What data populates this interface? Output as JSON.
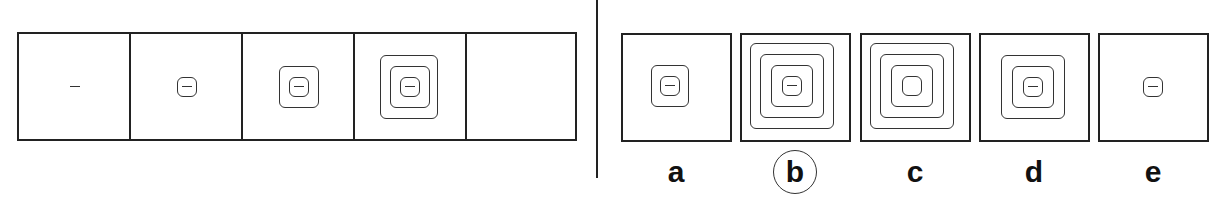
{
  "puzzle": {
    "sequence": {
      "cells": [
        {
          "index": 1,
          "squares": 0,
          "has_dash": true
        },
        {
          "index": 2,
          "squares": 1,
          "has_dash": true
        },
        {
          "index": 3,
          "squares": 2,
          "has_dash": true
        },
        {
          "index": 4,
          "squares": 3,
          "has_dash": true
        },
        {
          "index": 5,
          "squares": null,
          "has_dash": false,
          "empty": true
        }
      ]
    },
    "options": [
      {
        "label": "a",
        "squares": 2,
        "has_dash": true,
        "selected": false
      },
      {
        "label": "b",
        "squares": 4,
        "has_dash": true,
        "selected": true
      },
      {
        "label": "c",
        "squares": 4,
        "has_dash": false,
        "selected": false
      },
      {
        "label": "d",
        "squares": 3,
        "has_dash": true,
        "selected": false
      },
      {
        "label": "e",
        "squares": 1,
        "has_dash": true,
        "selected": false
      }
    ],
    "answer": "b",
    "colors": {
      "line": "#222222",
      "background": "#ffffff"
    }
  }
}
